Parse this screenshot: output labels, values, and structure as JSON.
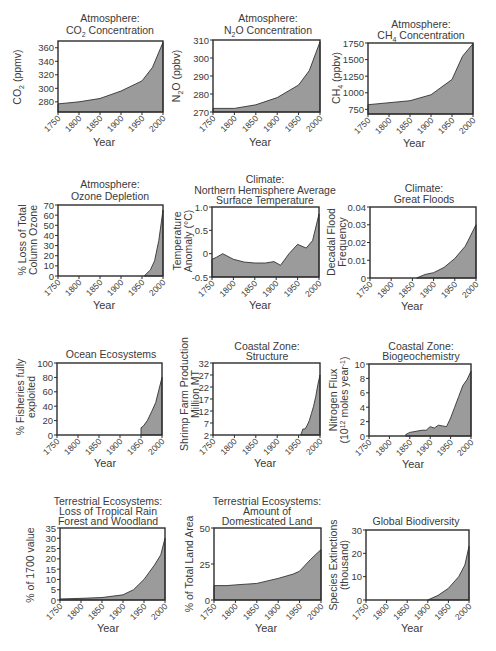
{
  "chart_data": [
    {
      "id": "co2",
      "type": "area",
      "title": "Atmosphere: CO2 Concentration",
      "title_lines": [
        "Atmosphere:",
        "CO",
        "2",
        " Concentration"
      ],
      "xlabel": "Year",
      "ylabel": "CO2 (ppmv)",
      "ylabel_parts": [
        "CO",
        "2",
        " (ppmv)"
      ],
      "x": [
        1750,
        1800,
        1850,
        1900,
        1950,
        1975,
        2000
      ],
      "y": [
        277,
        280,
        285,
        296,
        311,
        331,
        368
      ],
      "ylim": [
        265,
        370
      ],
      "xlim": [
        1750,
        2000
      ],
      "yticks": [
        280,
        300,
        320,
        340,
        360
      ],
      "xticks": [
        1750,
        1800,
        1850,
        1900,
        1950,
        2000
      ]
    },
    {
      "id": "n2o",
      "type": "area",
      "title": "Atmosphere: N2O Concentration",
      "title_lines": [
        "Atmosphere:",
        "N",
        "2",
        "O Concentration"
      ],
      "xlabel": "Year",
      "ylabel": "N2O (ppbv)",
      "ylabel_parts": [
        "N",
        "2",
        "O (ppbv)"
      ],
      "x": [
        1750,
        1800,
        1850,
        1900,
        1950,
        1975,
        2000
      ],
      "y": [
        272,
        272,
        274,
        278,
        285,
        293,
        309
      ],
      "ylim": [
        270,
        310
      ],
      "xlim": [
        1750,
        2000
      ],
      "yticks": [
        270,
        280,
        290,
        300,
        310
      ],
      "xticks": [
        1750,
        1800,
        1850,
        1900,
        1950,
        2000
      ]
    },
    {
      "id": "ch4",
      "type": "area",
      "title": "Atmosphere: CH4 Concentration",
      "title_lines": [
        "Atmosphere:",
        "CH",
        "4",
        " Concentration"
      ],
      "xlabel": "Year",
      "ylabel": "CH4 (ppbv)",
      "ylabel_parts": [
        "CH",
        "4",
        " (ppbv)"
      ],
      "x": [
        1750,
        1800,
        1850,
        1900,
        1950,
        1975,
        2000
      ],
      "y": [
        820,
        850,
        880,
        970,
        1200,
        1550,
        1740
      ],
      "ylim": [
        680,
        1750
      ],
      "xlim": [
        1750,
        2000
      ],
      "yticks": [
        750,
        1000,
        1250,
        1500,
        1750
      ],
      "xticks": [
        1750,
        1800,
        1850,
        1900,
        1950,
        2000
      ]
    },
    {
      "id": "ozone",
      "type": "area",
      "title": "Atmosphere: Ozone Depletion",
      "title_lines": [
        "Atmosphere:",
        "Ozone Depletion"
      ],
      "xlabel": "Year",
      "ylabel": "% Loss of Total Column Ozone",
      "ylabel_lines": [
        "% Loss of Total",
        "Column Ozone"
      ],
      "x": [
        1955,
        1970,
        1980,
        1990,
        2000
      ],
      "y": [
        0,
        6,
        15,
        35,
        65
      ],
      "ylim": [
        0,
        70
      ],
      "xlim": [
        1750,
        2000
      ],
      "yticks": [
        0,
        10,
        20,
        30,
        40,
        50,
        60,
        70
      ],
      "xticks": [
        1750,
        1800,
        1850,
        1900,
        1950,
        2000
      ]
    },
    {
      "id": "temperature",
      "type": "area",
      "title": "Climate: Northern Hemisphere Average Surface Temperature",
      "title_lines": [
        "Climate:",
        "Northern Hemisphere Average",
        "Surface Temperature"
      ],
      "xlabel": "Year",
      "ylabel": "Temperature Anomaly (°C)",
      "ylabel_lines": [
        "Temperature",
        "Anomaly (°C)"
      ],
      "x": [
        1750,
        1760,
        1775,
        1800,
        1825,
        1850,
        1875,
        1895,
        1910,
        1930,
        1950,
        1970,
        1985,
        2000
      ],
      "y": [
        -0.12,
        -0.08,
        0.0,
        -0.12,
        -0.18,
        -0.2,
        -0.2,
        -0.17,
        -0.25,
        0.0,
        0.2,
        0.12,
        0.28,
        0.85
      ],
      "ylim": [
        -0.5,
        1.0
      ],
      "xlim": [
        1750,
        2000
      ],
      "yticks": [
        -0.5,
        0,
        0.5,
        1.0
      ],
      "ytick_labels": [
        "-0.5",
        "0",
        "0.5",
        "1.0"
      ],
      "xticks": [
        1750,
        1800,
        1850,
        1900,
        1950,
        2000
      ]
    },
    {
      "id": "floods",
      "type": "area",
      "title": "Climate: Great Floods",
      "title_lines": [
        "Climate:",
        "Great Floods"
      ],
      "xlabel": "Year",
      "ylabel": "Decadal Flood Frequency",
      "ylabel_lines": [
        "Decadal Flood",
        "Frequency"
      ],
      "x": [
        1860,
        1880,
        1900,
        1925,
        1950,
        1975,
        2000
      ],
      "y": [
        0,
        0.002,
        0.003,
        0.006,
        0.011,
        0.018,
        0.03
      ],
      "ylim": [
        0,
        0.04
      ],
      "xlim": [
        1750,
        2000
      ],
      "yticks": [
        0,
        0.01,
        0.02,
        0.03,
        0.04
      ],
      "ytick_labels": [
        "0",
        "0.01",
        "0.02",
        "0.03",
        "0.04"
      ],
      "xticks": [
        1750,
        1800,
        1850,
        1900,
        1950,
        2000
      ]
    },
    {
      "id": "ocean",
      "type": "area",
      "title": "Ocean Ecosystems",
      "title_lines": [
        "Ocean Ecosystems"
      ],
      "xlabel": "Year",
      "ylabel": "% Fisheries fully exploited",
      "ylabel_lines": [
        "% Fisheries fully",
        "exploited"
      ],
      "x": [
        1950,
        1955,
        1965,
        1975,
        1985,
        2000
      ],
      "y": [
        10,
        12,
        20,
        32,
        45,
        80
      ],
      "ylim": [
        0,
        100
      ],
      "xlim": [
        1750,
        2000
      ],
      "yticks": [
        0,
        20,
        40,
        60,
        80,
        100
      ],
      "xticks": [
        1750,
        1800,
        1850,
        1900,
        1950,
        2000
      ]
    },
    {
      "id": "shrimp",
      "type": "area",
      "title": "Coastal Zone: Structure",
      "title_lines": [
        "Coastal Zone:",
        "Structure"
      ],
      "xlabel": "Year",
      "ylabel": "Shrimp Farm Production Million MT",
      "ylabel_lines": [
        "Shrimp Farm Production",
        "Million MT"
      ],
      "x": [
        1955,
        1960,
        1965,
        1970,
        1975,
        1980,
        1985,
        1990,
        1995,
        2000
      ],
      "y": [
        2,
        4.5,
        4.5,
        6,
        8,
        11,
        14,
        18,
        23,
        27
      ],
      "ylim": [
        2,
        32
      ],
      "xlim": [
        1750,
        2000
      ],
      "yticks": [
        2,
        7,
        12,
        17,
        22,
        27,
        32
      ],
      "xticks": [
        1750,
        1800,
        1850,
        1900,
        1950,
        2000
      ]
    },
    {
      "id": "nitrogen",
      "type": "area",
      "title": "Coastal Zone: Biogeochemistry",
      "title_lines": [
        "Coastal Zone:",
        "Biogeochemistry"
      ],
      "xlabel": "Year",
      "ylabel": "Nitrogen Flux (10^12 moles year^-1)",
      "ylabel_lines": [
        "Nitrogen Flux",
        "(10",
        "12",
        " moles year",
        "-1",
        ")"
      ],
      "x": [
        1840,
        1850,
        1860,
        1870,
        1880,
        1890,
        1900,
        1910,
        1920,
        1930,
        1940,
        1950,
        1960,
        1970,
        1980,
        1990,
        2000
      ],
      "y": [
        0.2,
        0.5,
        0.6,
        0.7,
        0.8,
        0.8,
        1.3,
        1.1,
        1.5,
        1.4,
        1.3,
        2.5,
        4.0,
        5.5,
        7.0,
        7.8,
        9.0
      ],
      "ylim": [
        0,
        10
      ],
      "xlim": [
        1750,
        2000
      ],
      "yticks": [
        0,
        2,
        4,
        6,
        8,
        10
      ],
      "xticks": [
        1750,
        1800,
        1850,
        1900,
        1950,
        2000
      ]
    },
    {
      "id": "forest",
      "type": "area",
      "title": "Terrestrial Ecosystems: Loss of Tropical Rain Forest and Woodland",
      "title_lines": [
        "Terrestrial Ecosystems:",
        "Loss of Tropical Rain",
        "Forest and Woodland"
      ],
      "xlabel": "Year",
      "ylabel": "% of 1700 value",
      "x": [
        1750,
        1800,
        1850,
        1900,
        1925,
        1950,
        1975,
        1990,
        2000
      ],
      "y": [
        0.5,
        0.8,
        1.2,
        2.5,
        5,
        10,
        17,
        22,
        30
      ],
      "ylim": [
        0,
        35
      ],
      "xlim": [
        1750,
        2000
      ],
      "yticks": [
        0,
        5,
        10,
        15,
        20,
        25,
        30,
        35
      ],
      "xticks": [
        1750,
        1800,
        1850,
        1900,
        1950,
        2000
      ]
    },
    {
      "id": "land",
      "type": "area",
      "title": "Terrestrial Ecosystems: Amount of Domesticated Land",
      "title_lines": [
        "Terrestrial Ecosystems:",
        "Amount of",
        "Domesticated Land"
      ],
      "xlabel": "Year",
      "ylabel": "% of Total Land Area",
      "x": [
        1750,
        1780,
        1800,
        1850,
        1900,
        1935,
        1950,
        1975,
        2000
      ],
      "y": [
        10,
        10,
        10.5,
        11.5,
        15,
        18,
        20,
        28,
        35
      ],
      "ylim": [
        0,
        50
      ],
      "xlim": [
        1750,
        2000
      ],
      "yticks": [
        0,
        25,
        50
      ],
      "xticks": [
        1750,
        1800,
        1850,
        1900,
        1950,
        2000
      ]
    },
    {
      "id": "biodiversity",
      "type": "area",
      "title": "Global Biodiversity",
      "title_lines": [
        "Global Biodiversity"
      ],
      "xlabel": "Year",
      "ylabel": "Species Extinctions (thousand)",
      "ylabel_lines": [
        "Species Extinctions",
        "(thousand)"
      ],
      "x": [
        1900,
        1925,
        1950,
        1975,
        1990,
        2000
      ],
      "y": [
        0,
        2,
        5,
        10,
        15,
        23
      ],
      "ylim": [
        0,
        30
      ],
      "xlim": [
        1750,
        2000
      ],
      "yticks": [
        0,
        10,
        20,
        30
      ],
      "xticks": [
        1750,
        1800,
        1850,
        1900,
        1950,
        2000
      ]
    }
  ],
  "style": {
    "fill_color": "#9b9b9b",
    "line_color": "#333333",
    "text_color": "#3a3a3a"
  },
  "labels": {
    "year": "Year",
    "xticks": [
      "1750",
      "1800",
      "1850",
      "1900",
      "1950",
      "2000"
    ],
    "co2": {
      "t1": "Atmosphere:",
      "t2a": "CO",
      "t2b": "2",
      "t2c": " Concentration",
      "ya": "CO",
      "yb": "2",
      "yc": " (ppmv)",
      "yt": [
        "280",
        "300",
        "320",
        "340",
        "360"
      ]
    },
    "n2o": {
      "t1": "Atmosphere:",
      "t2a": "N",
      "t2b": "2",
      "t2c": "O Concentration",
      "ya": "N",
      "yb": "2",
      "yc": "O (ppbv)",
      "yt": [
        "270",
        "280",
        "290",
        "300",
        "310"
      ]
    },
    "ch4": {
      "t1": "Atmosphere:",
      "t2a": "CH",
      "t2b": "4",
      "t2c": " Concentration",
      "ya": "CH",
      "yb": "4",
      "yc": " (ppbv)",
      "yt": [
        "750",
        "1000",
        "1250",
        "1500",
        "1750"
      ]
    },
    "ozone": {
      "t1": "Atmosphere:",
      "t2": "Ozone Depletion",
      "y1": "% Loss of Total",
      "y2": "Column Ozone",
      "yt": [
        "0",
        "10",
        "20",
        "30",
        "40",
        "50",
        "60",
        "70"
      ]
    },
    "temp": {
      "t1": "Climate:",
      "t2": "Northern Hemisphere Average",
      "t3": "Surface Temperature",
      "y1": "Temperature",
      "y2": "Anomaly (°C)",
      "yt": [
        "-0.5",
        "0",
        "0.5",
        "1.0"
      ]
    },
    "floods": {
      "t1": "Climate:",
      "t2": "Great Floods",
      "y1": "Decadal Flood",
      "y2": "Frequency",
      "yt": [
        "0",
        "0.01",
        "0.02",
        "0.03",
        "0.04"
      ]
    },
    "ocean": {
      "t1": "Ocean Ecosystems",
      "y1": "% Fisheries fully",
      "y2": "exploited",
      "yt": [
        "0",
        "20",
        "40",
        "60",
        "80",
        "100"
      ]
    },
    "shrimp": {
      "t1": "Coastal Zone:",
      "t2": "Structure",
      "y1": "Shrimp Farm Production",
      "y2": "Million MT",
      "yt": [
        "2",
        "7",
        "12",
        "17",
        "22",
        "27",
        "32"
      ]
    },
    "nitrogen": {
      "t1": "Coastal Zone:",
      "t2": "Biogeochemistry",
      "y1": "Nitrogen Flux",
      "y2a": "(10",
      "y2b": "12",
      "y2c": " moles year",
      "y2d": "-1",
      "y2e": ")",
      "yt": [
        "0",
        "2",
        "4",
        "6",
        "8",
        "10"
      ]
    },
    "forest": {
      "t1": "Terrestrial Ecosystems:",
      "t2": "Loss of Tropical Rain",
      "t3": "Forest and Woodland",
      "y1": "% of 1700 value",
      "yt": [
        "0",
        "5",
        "10",
        "15",
        "20",
        "25",
        "30",
        "35"
      ]
    },
    "land": {
      "t1": "Terrestrial Ecosystems:",
      "t2": "Amount of",
      "t3": "Domesticated Land",
      "y1": "% of Total Land Area",
      "yt": [
        "0",
        "25",
        "50"
      ]
    },
    "biodiv": {
      "t1": "Global Biodiversity",
      "y1": "Species Extinctions",
      "y2": "(thousand)",
      "yt": [
        "0",
        "10",
        "20",
        "30"
      ]
    }
  }
}
